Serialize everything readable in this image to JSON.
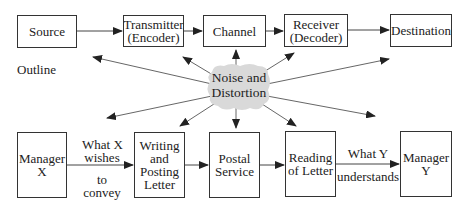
{
  "diagram": {
    "section_label": "Outline",
    "noise": {
      "label": "Noise and\nDistortion",
      "fill": "#d9d9d9"
    },
    "top_row": [
      {
        "id": "source",
        "label": "Source"
      },
      {
        "id": "transmitter",
        "label": "Transmitter\n(Encoder)"
      },
      {
        "id": "channel",
        "label": "Channel"
      },
      {
        "id": "receiver",
        "label": "Receiver\n(Decoder)"
      },
      {
        "id": "destination",
        "label": "Destination"
      }
    ],
    "bottom_row": [
      {
        "id": "manager-x",
        "label": "Manager\nX"
      },
      {
        "id": "writing",
        "label": "Writing\nand\nPosting\nLetter"
      },
      {
        "id": "postal",
        "label": "Postal\nService"
      },
      {
        "id": "reading",
        "label": "Reading\nof Letter"
      },
      {
        "id": "manager-y",
        "label": "Manager\nY"
      }
    ],
    "edge_labels": {
      "x_top": "What X",
      "x_mid": "wishes",
      "x_to": "to",
      "x_bottom": "convey",
      "y_top": "What Y",
      "y_bottom": "understands"
    },
    "colors": {
      "line": "#333333",
      "box_border": "#333333",
      "background": "#ffffff"
    }
  }
}
